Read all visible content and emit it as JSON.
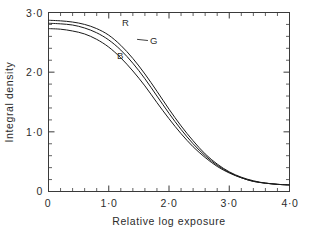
{
  "chart_data": {
    "type": "line",
    "title": "",
    "xlabel": "Relative log exposure",
    "ylabel": "Integral density",
    "xlim": [
      0,
      4.0
    ],
    "ylim": [
      0,
      3.0
    ],
    "grid": false,
    "legend_position": "inline-curve-labels",
    "xticks": [
      0,
      1.0,
      2.0,
      3.0,
      4.0
    ],
    "xtick_labels": [
      "0",
      "1·0",
      "2·0",
      "3·0",
      "4·0"
    ],
    "xminor_step": 0.2,
    "yticks": [
      0,
      1.0,
      2.0,
      3.0
    ],
    "ytick_labels": [
      "0",
      "1·0",
      "2·0",
      "3·0"
    ],
    "yminor_step": 0.2,
    "x": [
      0.0,
      0.2,
      0.4,
      0.6,
      0.8,
      1.0,
      1.2,
      1.4,
      1.6,
      1.8,
      2.0,
      2.2,
      2.4,
      2.6,
      2.8,
      3.0,
      3.2,
      3.4,
      3.6,
      3.8,
      4.0
    ],
    "series": [
      {
        "name": "R",
        "label": "R",
        "color": "#1a1a1a",
        "label_x": 1.28,
        "label_y": 2.78,
        "leader": false,
        "values": [
          2.87,
          2.86,
          2.84,
          2.8,
          2.73,
          2.62,
          2.45,
          2.23,
          1.97,
          1.68,
          1.38,
          1.1,
          0.85,
          0.63,
          0.46,
          0.33,
          0.24,
          0.18,
          0.14,
          0.12,
          0.11
        ]
      },
      {
        "name": "G",
        "label": "G",
        "color": "#1a1a1a",
        "label_x": 1.75,
        "label_y": 2.48,
        "leader": true,
        "leader_to_x": 1.47,
        "leader_to_y": 2.55,
        "values": [
          2.82,
          2.81,
          2.79,
          2.74,
          2.66,
          2.54,
          2.37,
          2.15,
          1.89,
          1.6,
          1.31,
          1.04,
          0.8,
          0.6,
          0.44,
          0.32,
          0.23,
          0.17,
          0.14,
          0.12,
          0.11
        ]
      },
      {
        "name": "B",
        "label": "B",
        "color": "#1a1a1a",
        "label_x": 1.19,
        "label_y": 2.22,
        "leader": false,
        "values": [
          2.73,
          2.72,
          2.69,
          2.64,
          2.55,
          2.42,
          2.24,
          2.02,
          1.77,
          1.49,
          1.22,
          0.97,
          0.75,
          0.57,
          0.42,
          0.31,
          0.23,
          0.17,
          0.14,
          0.12,
          0.11
        ]
      }
    ]
  },
  "axes": {
    "x_title": "Relative log exposure",
    "y_title": "Integral density"
  },
  "xlabels": {
    "t0": "0",
    "t1": "1·0",
    "t2": "2·0",
    "t3": "3·0",
    "t4": "4·0"
  },
  "ylabels": {
    "t0": "0",
    "t1": "1·0",
    "t2": "2·0",
    "t3": "3·0"
  },
  "curve_labels": {
    "r": "R",
    "g": "G",
    "b": "B"
  },
  "colors": {
    "line": "#1a1a1a",
    "axis": "#3a3a3a",
    "text": "#2b2b2b",
    "background": "#ffffff"
  }
}
